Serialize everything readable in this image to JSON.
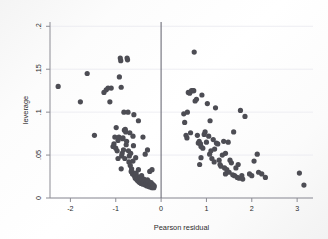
{
  "chart_data": {
    "type": "scatter",
    "title": "",
    "xlabel": "Pearson residual",
    "ylabel": "leverage",
    "xlim": [
      -2.45,
      3.35
    ],
    "ylim": [
      0,
      0.205
    ],
    "xticks": [
      -2,
      -1,
      0,
      1,
      2,
      3
    ],
    "xticklabels": [
      "-2",
      "-1",
      "0",
      "1",
      "2",
      "3"
    ],
    "yticks": [
      0,
      0.05,
      0.1,
      0.15,
      0.2
    ],
    "yticklabels": [
      "0",
      ".05",
      ".1",
      ".15",
      ".2"
    ],
    "grid": "horizontal",
    "legend": "none",
    "marker_color": "#4d4d54",
    "marker_size": 2.6,
    "reference_line": {
      "orientation": "vertical",
      "x": 0,
      "color": "#6e6e78"
    },
    "series": [
      {
        "name": "observations",
        "points": [
          [
            -2.27,
            0.13
          ],
          [
            -1.78,
            0.112
          ],
          [
            -1.63,
            0.145
          ],
          [
            -1.47,
            0.073
          ],
          [
            -1.26,
            0.123
          ],
          [
            -1.21,
            0.126
          ],
          [
            -1.17,
            0.128
          ],
          [
            -1.13,
            0.112
          ],
          [
            -1.1,
            0.128
          ],
          [
            -1.06,
            0.06
          ],
          [
            -1.04,
            0.063
          ],
          [
            -1.02,
            0.071
          ],
          [
            -1.0,
            0.058
          ],
          [
            -0.99,
            0.082
          ],
          [
            -0.97,
            0.055
          ],
          [
            -0.95,
            0.067
          ],
          [
            -0.93,
            0.071
          ],
          [
            -0.92,
            0.141
          ],
          [
            -0.9,
            0.163
          ],
          [
            -0.89,
            0.16
          ],
          [
            -0.88,
            0.129
          ],
          [
            -0.87,
            0.049
          ],
          [
            -0.86,
            0.052
          ],
          [
            -0.85,
            0.069
          ],
          [
            -0.84,
            0.07
          ],
          [
            -0.83,
            0.056
          ],
          [
            -0.82,
            0.1
          ],
          [
            -0.81,
            0.079
          ],
          [
            -0.8,
            0.046
          ],
          [
            -0.79,
            0.08
          ],
          [
            -0.78,
            0.077
          ],
          [
            -0.77,
            0.062
          ],
          [
            -0.76,
            0.066
          ],
          [
            -0.75,
            0.163
          ],
          [
            -0.74,
            0.161
          ],
          [
            -0.73,
            0.1
          ],
          [
            -0.72,
            0.055
          ],
          [
            -0.71,
            0.042
          ],
          [
            -0.7,
            0.049
          ],
          [
            -0.69,
            0.076
          ],
          [
            -0.68,
            0.038
          ],
          [
            -0.67,
            0.052
          ],
          [
            -0.66,
            0.031
          ],
          [
            -0.65,
            0.034
          ],
          [
            -0.64,
            0.03
          ],
          [
            -0.63,
            0.028
          ],
          [
            -0.62,
            0.072
          ],
          [
            -0.61,
            0.061
          ],
          [
            -0.6,
            0.029
          ],
          [
            -0.59,
            0.026
          ],
          [
            -0.58,
            0.027
          ],
          [
            -0.57,
            0.023
          ],
          [
            -0.56,
            0.024
          ],
          [
            -0.55,
            0.029
          ],
          [
            -0.54,
            0.022
          ],
          [
            -0.53,
            0.021
          ],
          [
            -0.52,
            0.025
          ],
          [
            -0.51,
            0.02
          ],
          [
            -0.5,
            0.09
          ],
          [
            -0.5,
            0.033
          ],
          [
            -0.49,
            0.019
          ],
          [
            -0.48,
            0.022
          ],
          [
            -0.47,
            0.018
          ],
          [
            -0.46,
            0.024
          ],
          [
            -0.45,
            0.02
          ],
          [
            -0.44,
            0.017
          ],
          [
            -0.43,
            0.026
          ],
          [
            -0.42,
            0.019
          ],
          [
            -0.41,
            0.021
          ],
          [
            -0.4,
            0.016
          ],
          [
            -0.4,
            0.071
          ],
          [
            -0.39,
            0.018
          ],
          [
            -0.38,
            0.022
          ],
          [
            -0.37,
            0.017
          ],
          [
            -0.36,
            0.02
          ],
          [
            -0.35,
            0.015
          ],
          [
            -0.35,
            0.051
          ],
          [
            -0.34,
            0.019
          ],
          [
            -0.33,
            0.016
          ],
          [
            -0.32,
            0.018
          ],
          [
            -0.31,
            0.014
          ],
          [
            -0.3,
            0.021
          ],
          [
            -0.3,
            0.056
          ],
          [
            -0.29,
            0.016
          ],
          [
            -0.28,
            0.014
          ],
          [
            -0.27,
            0.019
          ],
          [
            -0.26,
            0.013
          ],
          [
            -0.25,
            0.017
          ],
          [
            -0.25,
            0.031
          ],
          [
            -0.24,
            0.015
          ],
          [
            -0.23,
            0.013
          ],
          [
            -0.22,
            0.018
          ],
          [
            -0.21,
            0.014
          ],
          [
            -0.2,
            0.012
          ],
          [
            -0.2,
            0.033
          ],
          [
            -0.19,
            0.016
          ],
          [
            -0.18,
            0.013
          ],
          [
            -0.17,
            0.015
          ],
          [
            -0.16,
            0.012
          ],
          [
            -0.15,
            0.014
          ],
          [
            -0.6,
            0.097
          ],
          [
            -0.56,
            0.047
          ],
          [
            -0.62,
            0.043
          ],
          [
            -0.88,
            0.034
          ],
          [
            -0.95,
            0.046
          ],
          [
            0.5,
            0.098
          ],
          [
            0.52,
            0.088
          ],
          [
            0.55,
            0.073
          ],
          [
            0.57,
            0.07
          ],
          [
            0.6,
            0.123
          ],
          [
            0.63,
            0.122
          ],
          [
            0.65,
            0.076
          ],
          [
            0.67,
            0.125
          ],
          [
            0.7,
            0.125
          ],
          [
            0.72,
            0.125
          ],
          [
            0.73,
            0.17
          ],
          [
            0.75,
            0.113
          ],
          [
            0.78,
            0.115
          ],
          [
            0.8,
            0.073
          ],
          [
            0.82,
            0.064
          ],
          [
            0.84,
            0.066
          ],
          [
            0.85,
            0.039
          ],
          [
            0.87,
            0.063
          ],
          [
            0.88,
            0.06
          ],
          [
            0.9,
            0.12
          ],
          [
            0.92,
            0.058
          ],
          [
            0.95,
            0.074
          ],
          [
            0.97,
            0.077
          ],
          [
            1.0,
            0.065
          ],
          [
            1.02,
            0.11
          ],
          [
            1.05,
            0.072
          ],
          [
            1.07,
            0.051
          ],
          [
            1.1,
            0.055
          ],
          [
            1.12,
            0.046
          ],
          [
            1.15,
            0.068
          ],
          [
            1.17,
            0.042
          ],
          [
            1.2,
            0.105
          ],
          [
            1.22,
            0.064
          ],
          [
            1.25,
            0.063
          ],
          [
            1.28,
            0.044
          ],
          [
            1.3,
            0.039
          ],
          [
            1.32,
            0.037
          ],
          [
            1.35,
            0.05
          ],
          [
            1.38,
            0.066
          ],
          [
            1.4,
            0.035
          ],
          [
            1.42,
            0.028
          ],
          [
            1.45,
            0.033
          ],
          [
            1.48,
            0.065
          ],
          [
            1.5,
            0.03
          ],
          [
            1.52,
            0.044
          ],
          [
            1.55,
            0.041
          ],
          [
            1.58,
            0.027
          ],
          [
            1.6,
            0.077
          ],
          [
            1.62,
            0.026
          ],
          [
            1.65,
            0.035
          ],
          [
            1.68,
            0.024
          ],
          [
            1.7,
            0.039
          ],
          [
            1.72,
            0.023
          ],
          [
            1.75,
            0.102
          ],
          [
            1.78,
            0.026
          ],
          [
            1.8,
            0.022
          ],
          [
            1.85,
            0.095
          ],
          [
            1.95,
            0.028
          ],
          [
            2.0,
            0.026
          ],
          [
            2.05,
            0.043
          ],
          [
            2.12,
            0.051
          ],
          [
            2.15,
            0.03
          ],
          [
            2.22,
            0.028
          ],
          [
            2.3,
            0.024
          ],
          [
            3.05,
            0.029
          ],
          [
            3.15,
            0.015
          ],
          [
            0.88,
            0.047
          ],
          [
            1.08,
            0.09
          ],
          [
            1.18,
            0.057
          ],
          [
            1.42,
            0.052
          ],
          [
            0.58,
            0.1
          ]
        ]
      }
    ]
  }
}
